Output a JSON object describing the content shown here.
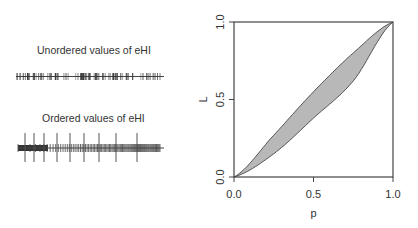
{
  "left_panel": {
    "unordered_title": "Unordered values of eHI",
    "ordered_title": "Ordered values of eHI"
  },
  "chart_data": [
    {
      "type": "strip",
      "title": "Unordered values of eHI",
      "description": "Rug/strip of eHI values in original (unordered) sequence; dense short vertical ticks along a horizontal line",
      "x_range_px": [
        16,
        164
      ],
      "n_ticks_approx": 100
    },
    {
      "type": "strip",
      "title": "Ordered values of eHI",
      "description": "Rug of eHI values sorted ascending; very dense (dark) on the left, sparser to the right, with long reference ticks",
      "long_tick_positions_px": [
        25,
        34,
        44,
        57,
        70,
        84,
        99,
        116,
        137
      ],
      "x_range_px": [
        18,
        164
      ]
    },
    {
      "type": "area",
      "title": "",
      "xlabel": "p",
      "ylabel": "L",
      "xlim": [
        0,
        1
      ],
      "ylim": [
        0,
        1
      ],
      "x_ticks": [
        "0.0",
        "0.5",
        "1.0"
      ],
      "y_ticks": [
        "0.0",
        "0.5",
        "1.0"
      ],
      "grid": false,
      "legend": null,
      "fill_color": "#b8b8b8",
      "series": [
        {
          "name": "upper curve",
          "x": [
            0,
            0.25,
            0.5,
            0.75,
            1
          ],
          "values": [
            0,
            0.27,
            0.55,
            0.8,
            1
          ]
        },
        {
          "name": "lower curve",
          "x": [
            0,
            0.25,
            0.5,
            0.75,
            1
          ],
          "values": [
            0,
            0.15,
            0.38,
            0.62,
            1
          ]
        }
      ]
    }
  ],
  "axes": {
    "x_label": "p",
    "y_label": "L",
    "x_ticks": [
      "0.0",
      "0.5",
      "1.0"
    ],
    "y_ticks": [
      "0.0",
      "0.5",
      "1.0"
    ]
  }
}
